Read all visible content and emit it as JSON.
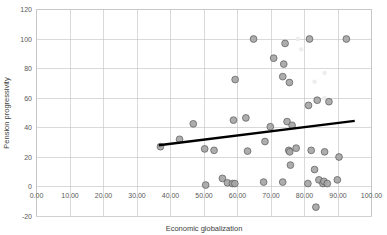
{
  "chart_data": {
    "type": "scatter",
    "title": "",
    "xlabel": "Economic globalization",
    "ylabel": "Pension progressivity",
    "xlim": [
      0,
      100
    ],
    "ylim": [
      -20,
      120
    ],
    "grid": true,
    "legend": "none",
    "xticks": [
      "0.00",
      "10.00",
      "20.00",
      "30.00",
      "40.00",
      "50.00",
      "60.00",
      "70.00",
      "80.00",
      "90.00",
      "100.00"
    ],
    "xtick_values": [
      0,
      10,
      20,
      30,
      40,
      50,
      60,
      70,
      80,
      90,
      100
    ],
    "yticks": [
      "-20",
      "0",
      "20",
      "40",
      "60",
      "80",
      "100",
      "120"
    ],
    "ytick_values": [
      -20,
      0,
      20,
      40,
      60,
      80,
      100,
      120
    ],
    "marker_fill": "#a6a6a6",
    "marker_edge": "#595959",
    "marker_radius": 3.4,
    "points": [
      {
        "x": 37.0,
        "y": 27.0
      },
      {
        "x": 42.7,
        "y": 32.0
      },
      {
        "x": 46.8,
        "y": 42.5
      },
      {
        "x": 50.2,
        "y": 25.5
      },
      {
        "x": 50.5,
        "y": 1.0
      },
      {
        "x": 53.0,
        "y": 24.5
      },
      {
        "x": 55.5,
        "y": 5.5
      },
      {
        "x": 57.0,
        "y": 2.5
      },
      {
        "x": 58.5,
        "y": 2.0
      },
      {
        "x": 59.2,
        "y": 2.0
      },
      {
        "x": 58.8,
        "y": 45.0
      },
      {
        "x": 59.3,
        "y": 72.5
      },
      {
        "x": 62.5,
        "y": 46.5
      },
      {
        "x": 63.0,
        "y": 24.0
      },
      {
        "x": 64.8,
        "y": 100.0
      },
      {
        "x": 67.8,
        "y": 3.0
      },
      {
        "x": 68.2,
        "y": 30.5
      },
      {
        "x": 69.8,
        "y": 40.5
      },
      {
        "x": 70.8,
        "y": 87.0
      },
      {
        "x": 73.5,
        "y": 3.0
      },
      {
        "x": 73.8,
        "y": 83.0
      },
      {
        "x": 73.5,
        "y": 74.5
      },
      {
        "x": 74.2,
        "y": 97.0
      },
      {
        "x": 74.8,
        "y": 44.0
      },
      {
        "x": 75.3,
        "y": 24.5
      },
      {
        "x": 75.5,
        "y": 70.5
      },
      {
        "x": 75.6,
        "y": 23.5
      },
      {
        "x": 75.8,
        "y": 14.5
      },
      {
        "x": 76.3,
        "y": 41.5
      },
      {
        "x": 77.5,
        "y": 26.0
      },
      {
        "x": 81.0,
        "y": 2.0
      },
      {
        "x": 81.2,
        "y": 55.0
      },
      {
        "x": 81.5,
        "y": 100.0
      },
      {
        "x": 82.0,
        "y": 24.5
      },
      {
        "x": 83.0,
        "y": 11.5
      },
      {
        "x": 83.4,
        "y": -14.0
      },
      {
        "x": 83.8,
        "y": 58.5
      },
      {
        "x": 84.3,
        "y": 4.5
      },
      {
        "x": 85.5,
        "y": 2.0
      },
      {
        "x": 85.8,
        "y": 3.5
      },
      {
        "x": 86.0,
        "y": 23.5
      },
      {
        "x": 86.8,
        "y": 2.0
      },
      {
        "x": 87.3,
        "y": 57.5
      },
      {
        "x": 89.8,
        "y": 4.5
      },
      {
        "x": 90.3,
        "y": 20.0
      },
      {
        "x": 92.5,
        "y": 100.0
      }
    ],
    "trendline": {
      "x_start": 36.5,
      "y_start": 28.0,
      "x_end": 95.0,
      "y_end": 44.5,
      "color": "#000000",
      "width": 2.4
    }
  }
}
